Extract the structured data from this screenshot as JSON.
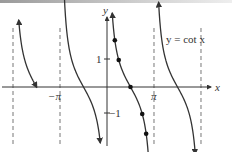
{
  "chart_data": {
    "type": "line",
    "title": "",
    "legend_label": "y = cot x",
    "xlabel": "x",
    "ylabel": "y",
    "x_ticks": [
      {
        "value": -3.14159,
        "label": "−π"
      },
      {
        "value": 3.14159,
        "label": "π"
      }
    ],
    "y_ticks": [
      {
        "value": 1,
        "label": "1"
      },
      {
        "value": -1,
        "label": "−1"
      }
    ],
    "xlim": [
      -7.0,
      7.0
    ],
    "ylim": [
      -2.0,
      2.8
    ],
    "asymptotes": [
      -6.28318,
      -3.14159,
      0,
      3.14159,
      6.28318
    ],
    "asymptote_style": "dashed",
    "grid": false,
    "series": [
      {
        "name": "cot x branch 1",
        "x_range": [
          -5.9,
          -4.7
        ],
        "function": "cot"
      },
      {
        "name": "cot x branch 2",
        "x_range": [
          -2.9,
          -0.45
        ],
        "function": "cot"
      },
      {
        "name": "cot x branch 3",
        "x_range": [
          0.35,
          2.8
        ],
        "function": "cot"
      },
      {
        "name": "cot x branch 4",
        "x_range": [
          3.45,
          5.9
        ],
        "function": "cot"
      }
    ],
    "highlighted_points": [
      {
        "x": 0.5236,
        "y": 1.732,
        "label": "π/6"
      },
      {
        "x": 0.7854,
        "y": 1.0,
        "label": "π/4"
      },
      {
        "x": 1.5708,
        "y": 0.0,
        "label": "π/2"
      },
      {
        "x": 2.3562,
        "y": -1.0,
        "label": "3π/4"
      },
      {
        "x": 2.618,
        "y": -1.732,
        "label": "5π/6"
      }
    ]
  },
  "labels": {
    "x_axis": "x",
    "y_axis": "y",
    "neg_pi": "−π",
    "pi": "π",
    "one": "1",
    "neg_one": "−1",
    "equation": "y = cot x"
  }
}
